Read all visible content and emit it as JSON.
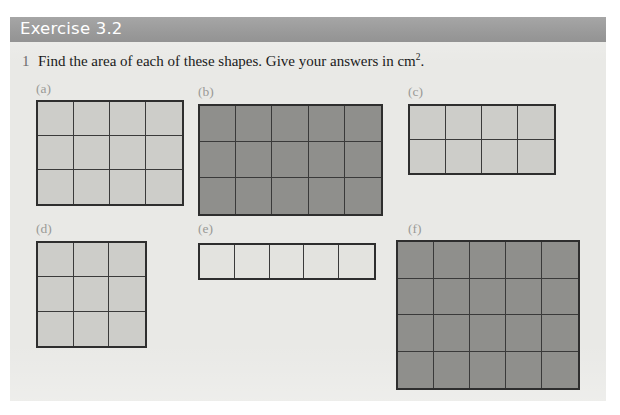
{
  "page": {
    "background_color": "#ffffff",
    "panel_color": "#e9e9e6"
  },
  "header": {
    "title": "Exercise 3.2",
    "bar_color": "#9d9d9d",
    "text_color": "#ffffff"
  },
  "question": {
    "number": "1",
    "text_before_sup": "Find the area of each of these shapes. Give your answers in cm",
    "superscript": "2",
    "text_after_sup": ".",
    "full_text": "Find the area of each of these shapes. Give your answers in cm2."
  },
  "shapes": [
    {
      "label": "(a)",
      "cols": 4,
      "rows": 3,
      "area_squares": 12,
      "fill": "light",
      "fill_color": "#cdcdc9",
      "border_color": "#2e2e2e",
      "x": 36,
      "y": 82,
      "grid_x": 36,
      "grid_y": 100,
      "width": 148,
      "height": 106
    },
    {
      "label": "(b)",
      "cols": 5,
      "rows": 3,
      "area_squares": 15,
      "fill": "dark",
      "fill_color": "#8f8f8c",
      "border_color": "#2e2e2e",
      "x": 198,
      "y": 85,
      "grid_x": 198,
      "grid_y": 104,
      "width": 185,
      "height": 112
    },
    {
      "label": "(c)",
      "cols": 4,
      "rows": 2,
      "area_squares": 8,
      "fill": "light",
      "fill_color": "#cdcdc9",
      "border_color": "#2e2e2e",
      "x": 408,
      "y": 85,
      "grid_x": 408,
      "grid_y": 104,
      "width": 148,
      "height": 71
    },
    {
      "label": "(d)",
      "cols": 3,
      "rows": 3,
      "area_squares": 9,
      "fill": "light",
      "fill_color": "#cdcdc9",
      "border_color": "#2e2e2e",
      "x": 36,
      "y": 222,
      "grid_x": 36,
      "grid_y": 241,
      "width": 111,
      "height": 107
    },
    {
      "label": "(e)",
      "cols": 5,
      "rows": 1,
      "area_squares": 5,
      "fill": "pale",
      "fill_color": "#e3e3df",
      "border_color": "#2e2e2e",
      "x": 198,
      "y": 222,
      "grid_x": 198,
      "grid_y": 243,
      "width": 178,
      "height": 37
    },
    {
      "label": "(f)",
      "cols": 5,
      "rows": 4,
      "area_squares": 20,
      "fill": "dark",
      "fill_color": "#8f8f8c",
      "border_color": "#2e2e2e",
      "x": 408,
      "y": 222,
      "grid_x": 396,
      "grid_y": 240,
      "width": 184,
      "height": 150
    }
  ]
}
